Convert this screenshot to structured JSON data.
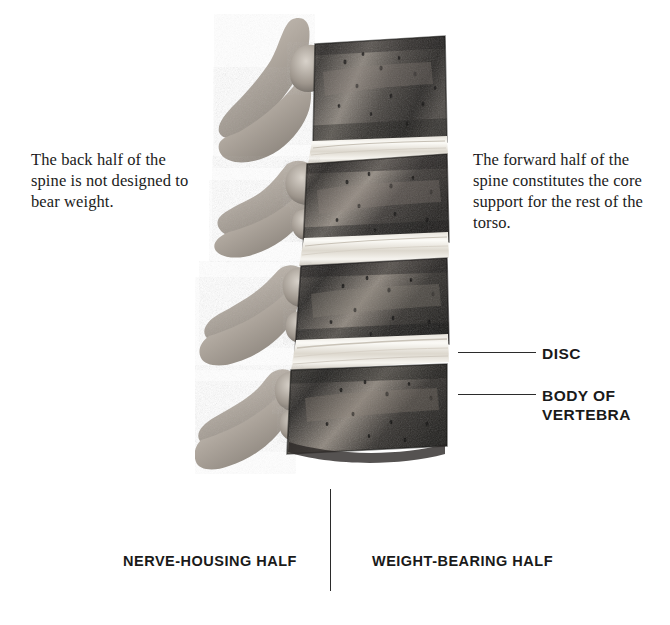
{
  "figure": {
    "palette": {
      "background": "#ffffff",
      "ink": "#1a1a1a",
      "leader_line": "#2b2b2b",
      "vertebral_body_dark": "#2e2c2a",
      "vertebral_body_mid": "#6b6561",
      "posterior_element_light": "#b9b2aa",
      "disc_white": "#f4f2ed"
    }
  },
  "notes": {
    "left": "The back half of the spine is not designed to bear weight.",
    "right": "The forward half of the spine constitutes the core support for the rest of the torso."
  },
  "callouts": [
    {
      "id": "disc",
      "label": "DISC"
    },
    {
      "id": "body-of-vertebra",
      "label": "BODY OF VERTEBRA"
    }
  ],
  "half_captions": {
    "left": "NERVE-HOUSING HALF",
    "right": "WEIGHT-BEARING HALF"
  },
  "icons": {
    "divider": "vertical-divider",
    "leader": "leader-line"
  }
}
